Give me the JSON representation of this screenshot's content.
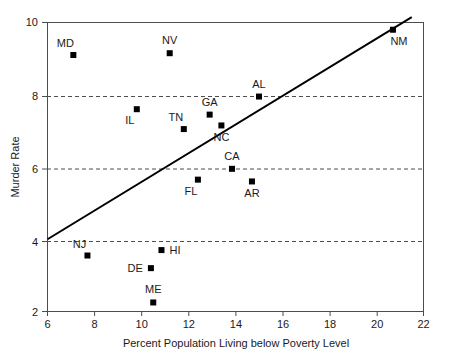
{
  "chart_data": {
    "type": "scatter",
    "title": "",
    "xlabel": "Percent Population Living below Poverty Level",
    "ylabel": "Murder Rate",
    "xlim": [
      6,
      22
    ],
    "ylim": [
      2,
      10
    ],
    "xticks": [
      6,
      8,
      10,
      12,
      14,
      16,
      18,
      20,
      22
    ],
    "yticks": [
      2,
      4,
      6,
      8,
      10
    ],
    "grid": "horizontal-dashed-at-4-6-8",
    "legend": "none",
    "marker_style": "filled-square",
    "marker_color": "#000000",
    "points": [
      {
        "label": "MD",
        "x": 7.1,
        "y": 9.1,
        "label_pos": "above-left"
      },
      {
        "label": "NV",
        "x": 11.2,
        "y": 9.15,
        "label_pos": "above"
      },
      {
        "label": "NM",
        "x": 20.7,
        "y": 9.8,
        "label_pos": "below-right"
      },
      {
        "label": "IL",
        "x": 9.8,
        "y": 7.6,
        "label_pos": "below-left"
      },
      {
        "label": "GA",
        "x": 12.9,
        "y": 7.45,
        "label_pos": "above"
      },
      {
        "label": "TN",
        "x": 11.8,
        "y": 7.05,
        "label_pos": "above-left"
      },
      {
        "label": "NC",
        "x": 13.4,
        "y": 7.15,
        "label_pos": "below"
      },
      {
        "label": "AL",
        "x": 15.0,
        "y": 7.95,
        "label_pos": "above"
      },
      {
        "label": "CA",
        "x": 13.85,
        "y": 5.95,
        "label_pos": "above"
      },
      {
        "label": "FL",
        "x": 12.4,
        "y": 5.65,
        "label_pos": "below-left"
      },
      {
        "label": "AR",
        "x": 14.7,
        "y": 5.6,
        "label_pos": "below"
      },
      {
        "label": "NJ",
        "x": 7.7,
        "y": 3.55,
        "label_pos": "above-left"
      },
      {
        "label": "HI",
        "x": 10.85,
        "y": 3.7,
        "label_pos": "right"
      },
      {
        "label": "DE",
        "x": 10.4,
        "y": 3.2,
        "label_pos": "left"
      },
      {
        "label": "ME",
        "x": 10.5,
        "y": 2.25,
        "label_pos": "above"
      }
    ],
    "trendline": {
      "type": "linear-fit",
      "x_start": 6.0,
      "y_start": 4.0,
      "x_end": 21.5,
      "y_end": 10.15
    }
  }
}
